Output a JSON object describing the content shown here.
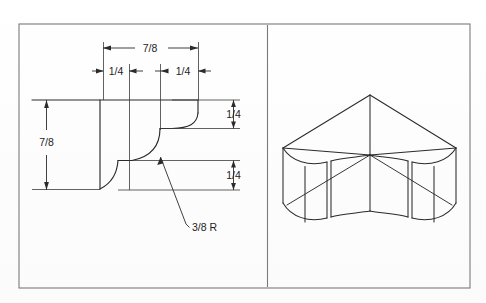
{
  "page": {
    "cut_off_caption": "of the drawing, as you learn the in",
    "background_color": "#fdfdfd",
    "line_color": "#2b2b2b",
    "frame_color": "#777777"
  },
  "frame": {
    "name": "drawing-border",
    "x": 19,
    "y": 24,
    "width": 451,
    "height": 264,
    "divider_x": 267
  },
  "left_view": {
    "title": "orthographic-profile-view",
    "dimensions": [
      {
        "id": "overall-width",
        "label": "7/8",
        "orientation": "horizontal",
        "x1": 103,
        "x2": 198,
        "y": 48
      },
      {
        "id": "left-step-width",
        "label": "1/4",
        "orientation": "horizontal",
        "x1": 103,
        "x2": 129,
        "y": 71
      },
      {
        "id": "right-step-width",
        "label": "1/4",
        "orientation": "horizontal",
        "x1": 172,
        "x2": 198,
        "y": 71
      },
      {
        "id": "overall-height",
        "label": "7/8",
        "orientation": "vertical",
        "x": 46,
        "y1": 100,
        "y2": 182
      },
      {
        "id": "upper-step-height",
        "label": "1/4",
        "orientation": "vertical",
        "x": 233,
        "y1": 100,
        "y2": 128
      },
      {
        "id": "lower-step-height",
        "label": "1/4",
        "orientation": "vertical",
        "x": 233,
        "y1": 160,
        "y2": 190
      }
    ],
    "notes": [
      {
        "id": "radius-note",
        "label": "3/8 R",
        "x": 191,
        "y": 228,
        "leader_from_x": 186,
        "leader_from_y": 224,
        "leader_to_x": 160,
        "leader_to_y": 157
      }
    ]
  },
  "right_view": {
    "title": "pictorial-isometric-view",
    "description": "isometric moulding corner block with concave quarter-round profile"
  }
}
